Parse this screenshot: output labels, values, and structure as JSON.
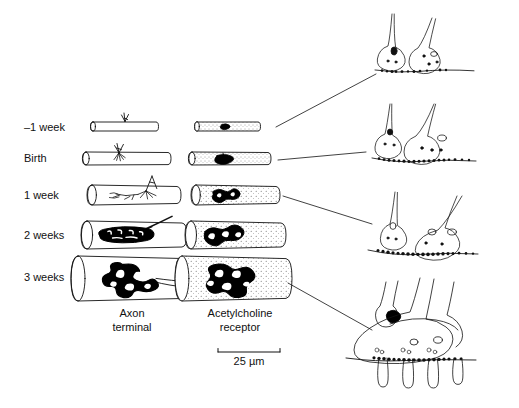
{
  "figure": {
    "background": "#ffffff",
    "ink": "#000000"
  },
  "timeline": {
    "rows": [
      {
        "id": "minus-1-week",
        "label": "–1 week",
        "y": 128
      },
      {
        "id": "birth",
        "label": "Birth",
        "y": 160
      },
      {
        "id": "1-week",
        "label": "1 week",
        "y": 199
      },
      {
        "id": "2-weeks",
        "label": "2 weeks",
        "y": 238
      },
      {
        "id": "3-weeks",
        "label": "3 weeks",
        "y": 280
      }
    ]
  },
  "columns": {
    "axon": {
      "label_line1": "Axon",
      "label_line2": "terminal"
    },
    "achr": {
      "label_line1": "Acetylcholine",
      "label_line2": "receptor"
    }
  },
  "scalebar": {
    "label": "25 µm",
    "length_px": 62
  },
  "panels": {
    "items": [
      {
        "id": "panel-embryonic",
        "stage": "–1 week"
      },
      {
        "id": "panel-birth",
        "stage": "Birth"
      },
      {
        "id": "panel-postnatal",
        "stage": "1–2 weeks"
      },
      {
        "id": "panel-mature",
        "stage": "3 weeks"
      }
    ]
  },
  "icons": {
    "muscle_fiber": "muscle-fiber-cylinder-icon",
    "nerve": "nerve-axon-icon",
    "receptor_plaque": "receptor-plaque-icon",
    "synapse": "synapse-terminal-icon",
    "scalebar": "scale-bar-icon"
  }
}
